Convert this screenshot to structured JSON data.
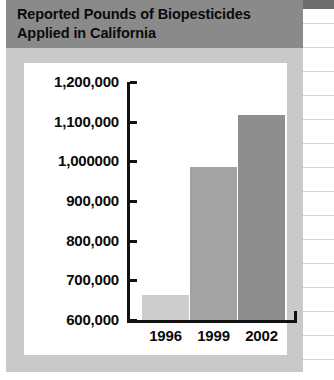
{
  "figure": {
    "title_line1": "Reported Pounds of Biopesticides",
    "title_line2": "Applied in California",
    "title_band_color": "#8a8a8a",
    "frame_color": "#c9c9c9",
    "panel_color": "#ffffff",
    "axis_color": "#121212"
  },
  "chart_data": {
    "type": "bar",
    "title": "Reported Pounds of Biopesticides Applied in California",
    "xlabel": "",
    "ylabel": "",
    "categories": [
      "1996",
      "1999",
      "2002"
    ],
    "values": [
      663000,
      985000,
      1116000
    ],
    "ylim": [
      600000,
      1200000
    ],
    "ytick_values": [
      600000,
      700000,
      800000,
      900000,
      1000000,
      1100000,
      1200000
    ],
    "ytick_labels": [
      "600,000",
      "700,000",
      "800,000",
      "900,000",
      "1,000000",
      "1,100,000",
      "1,200,000"
    ],
    "grid": false,
    "legend": null,
    "bar_colors": [
      "#cdcdcd",
      "#a3a3a3",
      "#8e8e8e"
    ]
  }
}
